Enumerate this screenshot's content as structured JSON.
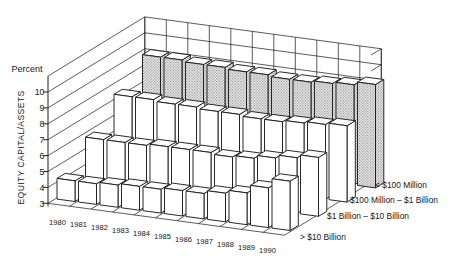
{
  "figure": {
    "background": "#ffffff",
    "percent_label": "Percent",
    "axis_title": "EQUITY CAPITAL/ASSETS"
  },
  "colors": {
    "line": "#1c1c1c",
    "text": "#161616",
    "bar_fill": "#ffffff",
    "hatch_dot": "#777777",
    "background": "#ffffff"
  },
  "chart_data": {
    "type": "bar",
    "subtype": "3d-bar-rows",
    "title": "",
    "unit_label": "Percent",
    "ylabel": "EQUITY CAPITAL/ASSETS",
    "xlabel": "",
    "ylim": [
      3,
      10
    ],
    "yticks": [
      3,
      4,
      5,
      6,
      7,
      8,
      9,
      10
    ],
    "grid": true,
    "legend_position": "right-of-rows",
    "categories": [
      "1980",
      "1981",
      "1982",
      "1983",
      "1984",
      "1985",
      "1986",
      "1987",
      "1988",
      "1989",
      "1990"
    ],
    "series": [
      {
        "name": "< $100 Million",
        "style": "hatched",
        "depth_row": "back",
        "values": [
          9.4,
          9.4,
          9.3,
          9.3,
          9.2,
          9.2,
          9.1,
          9.1,
          9.2,
          9.3,
          9.5
        ]
      },
      {
        "name": "$100 Million – $1 Billion",
        "style": "plain",
        "depth_row": "middle-back",
        "values": [
          7.8,
          7.8,
          7.7,
          7.7,
          7.6,
          7.6,
          7.5,
          7.5,
          7.6,
          7.7,
          7.8
        ]
      },
      {
        "name": "$1 Billion – $10 Billion",
        "style": "plain",
        "depth_row": "middle-front",
        "values": [
          6.0,
          6.0,
          6.0,
          6.1,
          6.1,
          6.1,
          6.0,
          6.1,
          6.3,
          6.5,
          6.7
        ]
      },
      {
        "name": "> $10 Billion",
        "style": "plain",
        "depth_row": "front",
        "values": [
          4.3,
          4.3,
          4.4,
          4.5,
          4.5,
          4.6,
          4.6,
          4.8,
          5.0,
          5.5,
          6.1
        ]
      }
    ]
  }
}
